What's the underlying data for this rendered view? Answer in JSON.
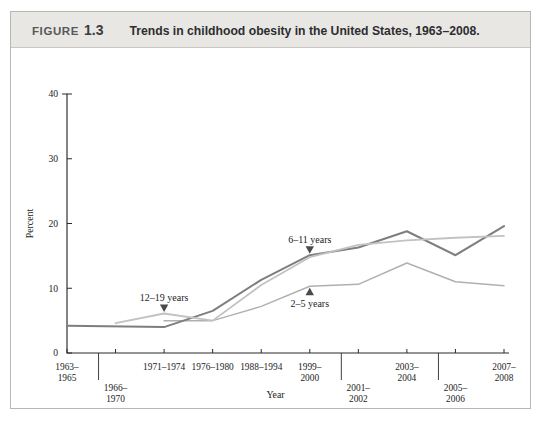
{
  "header": {
    "figure_label": "FIGURE",
    "figure_number": "1.3",
    "title": "Trends in childhood obesity in the United States, 1963–2008."
  },
  "chart_data": {
    "type": "line",
    "title": "Trends in childhood obesity in the United States, 1963–2008.",
    "xlabel": "Year",
    "ylabel": "Percent",
    "ylim": [
      0,
      40
    ],
    "yticks": [
      0,
      10,
      20,
      30,
      40
    ],
    "grid": false,
    "legend_position": "inline-annotations",
    "categories": [
      "1963–1965",
      "1966–1970",
      "1971–1974",
      "1976–1980",
      "1988–1994",
      "1999–2000",
      "2001–2002",
      "2003–2004",
      "2005–2006",
      "2007–2008"
    ],
    "category_rows": [
      {
        "label": "1963–1965",
        "row": 0
      },
      {
        "label": "1966–1970",
        "row": 1
      },
      {
        "label": "1971–1974",
        "row": 0
      },
      {
        "label": "1976–1980",
        "row": 0
      },
      {
        "label": "1988–1994",
        "row": 0
      },
      {
        "label": "1999–2000",
        "row": 0
      },
      {
        "label": "2001–2002",
        "row": 1
      },
      {
        "label": "2003–2004",
        "row": 0
      },
      {
        "label": "2005–2006",
        "row": 1
      },
      {
        "label": "2007–2008",
        "row": 0
      }
    ],
    "series": [
      {
        "name": "2–5 years",
        "color": "#b0b0b0",
        "x": [
          "1971–1974",
          "1976–1980",
          "1988–1994",
          "1999–2000",
          "2001–2002",
          "2003–2004",
          "2005–2006",
          "2007–2008"
        ],
        "values": [
          5.0,
          5.0,
          7.2,
          10.3,
          10.6,
          13.9,
          11.0,
          10.4
        ]
      },
      {
        "name": "6–11 years",
        "color": "#7e7e80",
        "x": [
          "1963–1965",
          "1971–1974",
          "1976–1980",
          "1988–1994",
          "1999–2000",
          "2001–2002",
          "2003–2004",
          "2005–2006",
          "2007–2008"
        ],
        "values": [
          4.2,
          4.0,
          6.5,
          11.3,
          15.1,
          16.3,
          18.8,
          15.1,
          19.6
        ]
      },
      {
        "name": "12–19 years",
        "color": "#c2c2c2",
        "x": [
          "1966–1970",
          "1971–1974",
          "1976–1980",
          "1988–1994",
          "1999–2000",
          "2001–2002",
          "2003–2004",
          "2005–2006",
          "2007–2008"
        ],
        "values": [
          4.6,
          6.1,
          5.0,
          10.5,
          14.8,
          16.7,
          17.4,
          17.8,
          18.1
        ]
      }
    ],
    "annotations": [
      {
        "text": "12–19 years",
        "marker": "triangle-down",
        "series": "12–19 years",
        "at_category": "1971–1974"
      },
      {
        "text": "6–11 years",
        "marker": "triangle-down",
        "series": "6–11 years",
        "at_category": "1999–2000"
      },
      {
        "text": "2–5 years",
        "marker": "triangle-up",
        "series": "2–5 years",
        "at_category": "1999–2000"
      }
    ]
  }
}
